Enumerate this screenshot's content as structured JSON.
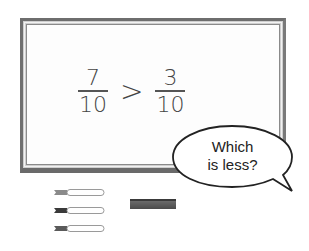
{
  "scene": {
    "title": "Whiteboard fraction comparison",
    "equation": {
      "left_fraction": {
        "numerator": "7",
        "denominator": "10"
      },
      "operator": ">",
      "right_fraction": {
        "numerator": "3",
        "denominator": "10"
      }
    },
    "speech_bubble": {
      "line1": "Which",
      "line2": "is less?"
    },
    "markers_count": 3,
    "colors": {
      "frame": "#6e6e6e",
      "board": "#fdfdfd",
      "text": "#444444",
      "eraser": "#555555"
    }
  }
}
